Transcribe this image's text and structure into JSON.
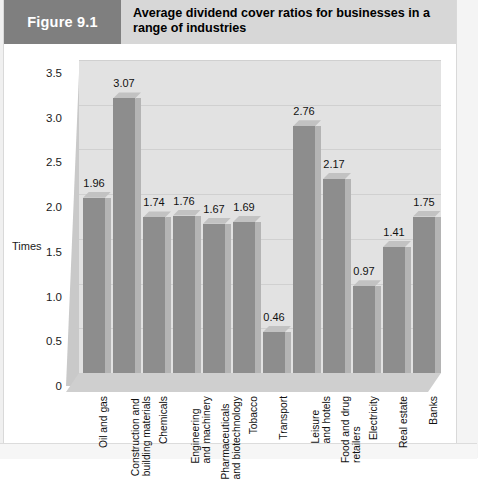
{
  "figure": {
    "number_label": "Figure 9.1",
    "title": "Average dividend cover ratios for businesses in a range of industries"
  },
  "chart_data": {
    "type": "bar",
    "title": "Average dividend cover ratios for businesses in a range of industries",
    "xlabel": "",
    "ylabel": "Times",
    "ylim": [
      0,
      3.5
    ],
    "yticks": [
      "0",
      "0.5",
      "1.0",
      "1.5",
      "2.0",
      "2.5",
      "3.0",
      "3.5"
    ],
    "ytick_values": [
      0,
      0.5,
      1.0,
      1.5,
      2.0,
      2.5,
      3.0,
      3.5
    ],
    "grid": true,
    "legend": "none",
    "style": "3d-bar",
    "categories": [
      "Oil and gas",
      "Construction and building materials",
      "Chemicals",
      "Engineering and machinery",
      "Pharmaceuticals and biotechnology",
      "Tobacco",
      "Transport",
      "Leisure and hotels",
      "Food and drug retailers",
      "Electricity",
      "Real estate",
      "Banks"
    ],
    "category_lines": [
      [
        "Oil and gas"
      ],
      [
        "Construction and",
        "building materials"
      ],
      [
        "Chemicals"
      ],
      [
        "Engineering",
        "and machinery"
      ],
      [
        "Pharmaceuticals",
        "and biotechnology"
      ],
      [
        "Tobacco"
      ],
      [
        "Transport"
      ],
      [
        "Leisure",
        "and hotels"
      ],
      [
        "Food and drug",
        "retailers"
      ],
      [
        "Electricity"
      ],
      [
        "Real estate"
      ],
      [
        "Banks"
      ]
    ],
    "values": [
      1.96,
      3.07,
      1.74,
      1.76,
      1.67,
      1.69,
      0.46,
      2.76,
      2.17,
      0.97,
      1.41,
      1.75
    ],
    "value_labels": [
      "1.96",
      "3.07",
      "1.74",
      "1.76",
      "1.67",
      "1.69",
      "0.46",
      "2.76",
      "2.17",
      "0.97",
      "1.41",
      "1.75"
    ]
  },
  "colors": {
    "figure_tab_bg": "#7f7f7f",
    "header_bg": "#d7d7d7",
    "bar_front": "#8d8d8d",
    "bar_side": "#b4b4b4",
    "bar_top": "#c2c2c2",
    "plot_bg": "#e2e2e2",
    "gridline": "#d0d0d0"
  }
}
